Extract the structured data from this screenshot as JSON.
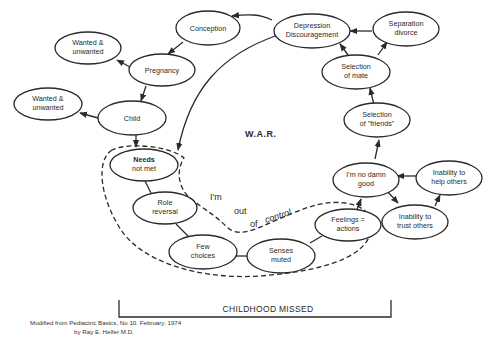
{
  "diagram": {
    "center_label": "W.A.R.",
    "nodes": {
      "conception": {
        "line1": "Conception",
        "line2": ""
      },
      "depression": {
        "line1": "Depression",
        "line2": "Discouragement"
      },
      "separation": {
        "line1": "Separation",
        "line2": "divorce"
      },
      "wanted1": {
        "line1": "Wanted &",
        "line2": "unwanted"
      },
      "pregnancy": {
        "line1": "Pregnancy",
        "line2": ""
      },
      "selection_mate": {
        "line1": "Selection",
        "line2": "of mate"
      },
      "wanted2": {
        "line1": "Wanted &",
        "line2": "unwanted"
      },
      "child": {
        "line1": "Child",
        "line2": ""
      },
      "selection_friends": {
        "line1": "Selection",
        "line2": "of \"friends\""
      },
      "needs": {
        "line1": "Needs",
        "line2": "not met"
      },
      "no_damn_good": {
        "line1": "I'm no damn",
        "line2": "good"
      },
      "help_others": {
        "line1": "Inability to",
        "line2": "help others"
      },
      "role_reversal": {
        "line1": "Role",
        "line2": "reversal"
      },
      "feelings": {
        "line1": "Feelings =",
        "line2": "actions"
      },
      "trust_others": {
        "line1": "Inability to",
        "line2": "trust others"
      },
      "few_choices": {
        "line1": "Few",
        "line2": "choices"
      },
      "senses_muted": {
        "line1": "Senses",
        "line2": "muted"
      }
    },
    "control_phrase": {
      "w1": "I'm",
      "w2": "out",
      "w3": "of",
      "w4": "control"
    },
    "bracket_label": "CHILDHOOD MISSED",
    "caption": {
      "line1": "Modified from Pediactric Basics, No 10, February, 1974",
      "line2": "by Ray E. Helfer  M.D."
    }
  }
}
